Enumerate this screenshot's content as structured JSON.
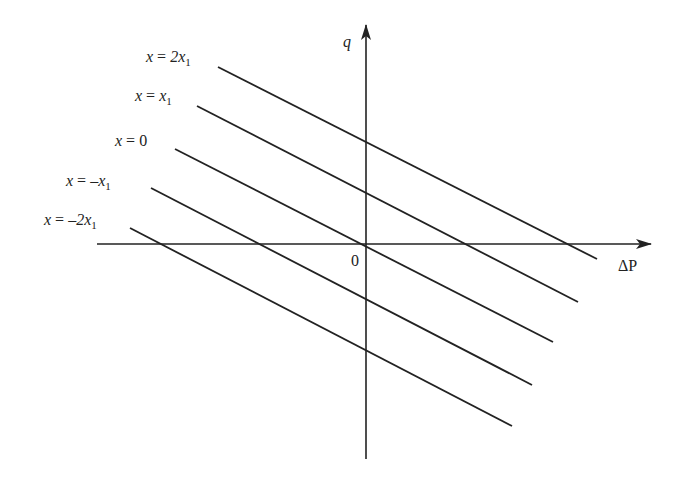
{
  "diagram": {
    "type": "family-of-parallel-lines",
    "axes": {
      "x_label": "ΔP",
      "y_label": "q",
      "origin_label": "0"
    },
    "lines": [
      {
        "label_var": "x",
        "label_eq": "=",
        "label_val": "2x",
        "label_sub": "1",
        "full_label": "x = 2x1"
      },
      {
        "label_var": "x",
        "label_eq": "=",
        "label_val": "x",
        "label_sub": "1",
        "full_label": "x = x1"
      },
      {
        "label_var": "x",
        "label_eq": "=",
        "label_val": "0",
        "label_sub": "",
        "full_label": "x = 0"
      },
      {
        "label_var": "x",
        "label_eq": "=",
        "label_val": "–x",
        "label_sub": "1",
        "full_label": "x = –x1"
      },
      {
        "label_var": "x",
        "label_eq": "=",
        "label_val": "–2x",
        "label_sub": "1",
        "full_label": "x = –2x1"
      }
    ],
    "colors": {
      "line": "#222222",
      "background": "#ffffff"
    }
  }
}
